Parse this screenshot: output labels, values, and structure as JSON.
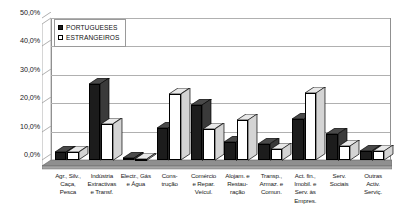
{
  "chart_data": {
    "type": "bar",
    "title": "",
    "subtitle": "",
    "xlabel": "",
    "ylabel": "",
    "ylim": [
      0,
      50
    ],
    "ytick_labels": [
      "0,0%",
      "10,0%",
      "20,0%",
      "30,0%",
      "40,0%",
      "50,0%"
    ],
    "ytick_values": [
      0,
      10,
      20,
      30,
      40,
      50
    ],
    "grid": true,
    "legend_position": "top-left",
    "value_suffix": "%",
    "categories": [
      "Agr., Silv.,\nCaça,\nPesca",
      "Indústria\nExtractivas\ne Transf.",
      "Electr., Gás\ne Água",
      "Cons-\ntrução",
      "Comércio\ne Repar.\nVeícul.",
      "Alojam. e\nRestau-\nração",
      "Transp.,\nArmaz. e\nComun.",
      "Act. fin.,\nImobil. e\nServ. às\nEmpres.",
      "Serv.\nSociais",
      "Outras\nActiv.\nServiç."
    ],
    "series": [
      {
        "name": "PORTUGUESES",
        "color": "#1c1c1c",
        "values": [
          2.8,
          26.8,
          0.6,
          11.3,
          19.5,
          6.5,
          5.7,
          14.3,
          9.3,
          3.3
        ]
      },
      {
        "name": "ESTRANGEIROS",
        "color": "#ffffff",
        "values": [
          2.7,
          12.8,
          0.3,
          23.2,
          11.0,
          14.2,
          4.0,
          23.5,
          5.0,
          3.2
        ]
      }
    ]
  }
}
